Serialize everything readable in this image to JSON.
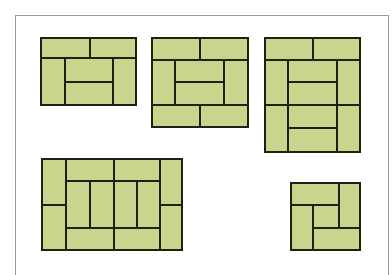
{
  "header": {
    "text": ""
  },
  "colors": {
    "mat_fill": "#cad48c",
    "mat_border": "#1f1f12",
    "frame_border": "#9a9a9a"
  },
  "layouts": [
    {
      "name": "six-mat-room",
      "mats": 6,
      "rects": [
        [
          40,
          37,
          51,
          22
        ],
        [
          89,
          37,
          48,
          22
        ],
        [
          40,
          57,
          26,
          49
        ],
        [
          64,
          57,
          50,
          26
        ],
        [
          64,
          81,
          50,
          25
        ],
        [
          112,
          57,
          25,
          49
        ]
      ]
    },
    {
      "name": "eight-mat-room",
      "mats": 8,
      "rects": [
        [
          151,
          37,
          50,
          24
        ],
        [
          199,
          37,
          50,
          24
        ],
        [
          151,
          59,
          25,
          47
        ],
        [
          174,
          59,
          51,
          24
        ],
        [
          174,
          81,
          51,
          25
        ],
        [
          223,
          59,
          26,
          47
        ],
        [
          151,
          104,
          50,
          24
        ],
        [
          199,
          104,
          50,
          24
        ]
      ]
    },
    {
      "name": "ten-mat-room",
      "mats": 10,
      "rects": [
        [
          264,
          37,
          50,
          24
        ],
        [
          312,
          37,
          49,
          24
        ],
        [
          264,
          59,
          25,
          47
        ],
        [
          264,
          104,
          25,
          49
        ],
        [
          287,
          59,
          51,
          24
        ],
        [
          287,
          81,
          51,
          25
        ],
        [
          287,
          104,
          51,
          25
        ],
        [
          287,
          127,
          51,
          26
        ],
        [
          336,
          59,
          25,
          47
        ],
        [
          336,
          104,
          25,
          49
        ]
      ]
    },
    {
      "name": "twelve-mat-room",
      "mats": 12,
      "rects": [
        [
          41,
          158,
          26,
          48
        ],
        [
          41,
          204,
          26,
          47
        ],
        [
          65,
          158,
          50,
          24
        ],
        [
          113,
          158,
          48,
          24
        ],
        [
          65,
          180,
          26,
          49
        ],
        [
          89,
          180,
          26,
          49
        ],
        [
          113,
          180,
          25,
          49
        ],
        [
          136,
          180,
          25,
          49
        ],
        [
          65,
          227,
          50,
          24
        ],
        [
          113,
          227,
          48,
          24
        ],
        [
          159,
          158,
          24,
          48
        ],
        [
          159,
          204,
          24,
          47
        ]
      ]
    },
    {
      "name": "four-and-half-mat-room",
      "mats": 4.5,
      "rects": [
        [
          290,
          182,
          50,
          24
        ],
        [
          338,
          182,
          23,
          47
        ],
        [
          312,
          204,
          28,
          25
        ],
        [
          290,
          204,
          24,
          47
        ],
        [
          312,
          227,
          49,
          24
        ]
      ]
    }
  ]
}
